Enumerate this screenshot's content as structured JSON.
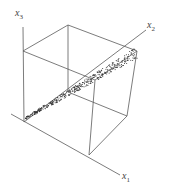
{
  "figure": {
    "type": "3d-scatter-in-cube",
    "axes": {
      "x1": {
        "label": "x",
        "sub": "1"
      },
      "x2": {
        "label": "x",
        "sub": "2"
      },
      "x3": {
        "label": "x",
        "sub": "3"
      }
    },
    "colors": {
      "lines": "#5a5a5a",
      "points": "#333333"
    }
  }
}
